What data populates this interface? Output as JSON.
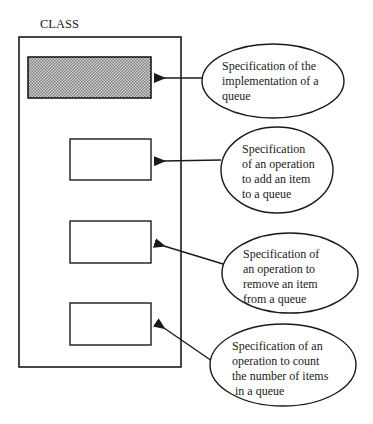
{
  "diagram": {
    "class_label": "CLASS",
    "colors": {
      "stroke": "#1a1a1a",
      "shaded_fill": "#b8b8b8",
      "background": "#ffffff"
    },
    "members": [
      {
        "id": "implementation",
        "shaded": true
      },
      {
        "id": "add-operation",
        "shaded": false
      },
      {
        "id": "remove-operation",
        "shaded": false
      },
      {
        "id": "count-operation",
        "shaded": false
      }
    ],
    "callouts": [
      {
        "target": "implementation",
        "lines": [
          "Specification of the",
          "implementation of a",
          "queue"
        ]
      },
      {
        "target": "add-operation",
        "lines": [
          "Specification",
          "of an operation",
          "to add an item",
          "to a queue"
        ]
      },
      {
        "target": "remove-operation",
        "lines": [
          "Specification of",
          "an operation to",
          "remove an item",
          "from a queue"
        ]
      },
      {
        "target": "count-operation",
        "lines": [
          "Specification of an",
          "operation to count",
          "the number of items",
          " in a queue"
        ]
      }
    ]
  }
}
